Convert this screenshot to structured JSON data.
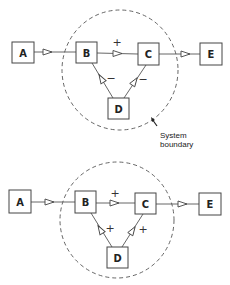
{
  "diagram_top": {
    "nodes": [
      {
        "id": "A",
        "label": "A"
      },
      {
        "id": "B",
        "label": "B"
      },
      {
        "id": "C",
        "label": "C"
      },
      {
        "id": "D",
        "label": "D"
      },
      {
        "id": "E",
        "label": "E"
      }
    ],
    "edges": [
      {
        "from": "A",
        "to": "B",
        "sign": ""
      },
      {
        "from": "B",
        "to": "C",
        "sign": "+"
      },
      {
        "from": "C",
        "to": "E",
        "sign": ""
      },
      {
        "from": "D",
        "to": "B",
        "sign": "−"
      },
      {
        "from": "D",
        "to": "C",
        "sign": "−"
      }
    ],
    "boundary_label_line1": "System",
    "boundary_label_line2": "boundary"
  },
  "diagram_bottom": {
    "nodes": [
      {
        "id": "A",
        "label": "A"
      },
      {
        "id": "B",
        "label": "B"
      },
      {
        "id": "C",
        "label": "C"
      },
      {
        "id": "D",
        "label": "D"
      },
      {
        "id": "E",
        "label": "E"
      }
    ],
    "edges": [
      {
        "from": "A",
        "to": "B",
        "sign": ""
      },
      {
        "from": "B",
        "to": "C",
        "sign": "+"
      },
      {
        "from": "C",
        "to": "E",
        "sign": ""
      },
      {
        "from": "D",
        "to": "B",
        "sign": "+"
      },
      {
        "from": "D",
        "to": "C",
        "sign": "+"
      }
    ]
  }
}
